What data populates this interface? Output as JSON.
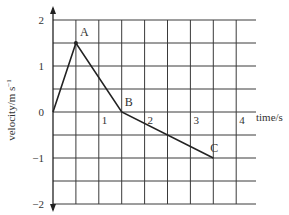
{
  "chart_data": {
    "type": "line",
    "title": "",
    "xlabel": "time/s",
    "ylabel": "velocity/m s^-1",
    "ylabel_main": "velocity/m s",
    "ylabel_sup": "−1",
    "xlim": [
      0,
      4.4
    ],
    "ylim": [
      -2,
      2
    ],
    "grid": true,
    "grid_step_x": 0.5,
    "grid_step_y": 0.5,
    "x_ticks": [
      "1",
      "2",
      "3",
      "4"
    ],
    "y_ticks": [
      "2",
      "1",
      "0",
      "−1",
      "−2"
    ],
    "series": [
      {
        "name": "velocity",
        "x": [
          0,
          0.5,
          1.5,
          3.5
        ],
        "y": [
          0,
          1.5,
          0,
          -1
        ],
        "point_labels": [
          "",
          "A",
          "B",
          "C"
        ]
      }
    ],
    "legend": null
  },
  "labels": {
    "A": "A",
    "B": "B",
    "C": "C"
  },
  "colors": {
    "grid": "#333333",
    "line": "#222222",
    "text": "#333333",
    "background": "#ffffff"
  }
}
